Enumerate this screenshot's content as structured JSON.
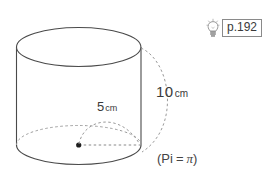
{
  "figure": {
    "type": "cylinder-diagram",
    "labels": {
      "height_value": "10",
      "height_unit": "cm",
      "radius_value": "5",
      "radius_unit": "cm"
    },
    "note": {
      "open_paren": "(Pi",
      "equals": "=",
      "pi_symbol": "π",
      "close_paren": ")"
    },
    "colors": {
      "outline": "#4a4a4a",
      "dashed": "#9a9a9a",
      "text": "#3a3a3a",
      "box_border": "#8a8a8a",
      "background": "#ffffff"
    }
  },
  "hint": {
    "icon": "lightbulb-icon",
    "page_reference": "p.192"
  }
}
